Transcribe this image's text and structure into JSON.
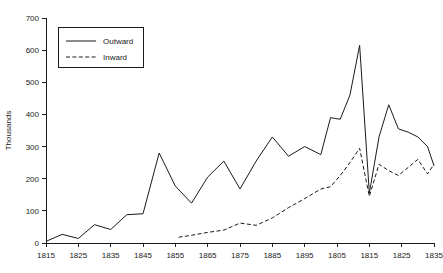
{
  "chart_data": {
    "type": "line",
    "title": "",
    "xlabel": "",
    "ylabel": "Thousands",
    "ylim": [
      0,
      700
    ],
    "ytick_step": 100,
    "ytick_labels": [
      "0",
      "100",
      "200",
      "300",
      "400",
      "500",
      "600",
      "700"
    ],
    "xtick_labels": [
      "1815",
      "1825",
      "1835",
      "1845",
      "1855",
      "1865",
      "1875",
      "1885",
      "1895",
      "1805",
      "1815",
      "1825",
      "1835"
    ],
    "xtick_years": [
      1815,
      1825,
      1835,
      1845,
      1855,
      1865,
      1875,
      1885,
      1895,
      1905,
      1915,
      1925,
      1935
    ],
    "x_range": [
      1815,
      1935
    ],
    "grid": false,
    "legend_position": "upper-left",
    "legend": [
      "Outward",
      "Inward"
    ],
    "line_color": "#1a1a1a",
    "background_color": "#ffffff",
    "series": [
      {
        "name": "Outward",
        "style": "solid",
        "x": [
          1815,
          1820,
          1825,
          1830,
          1835,
          1840,
          1845,
          1850,
          1855,
          1860,
          1865,
          1870,
          1875,
          1880,
          1885,
          1890,
          1895,
          1900,
          1903,
          1906,
          1909,
          1912,
          1915,
          1918,
          1921,
          1924,
          1927,
          1930,
          1933,
          1935
        ],
        "values": [
          5,
          27,
          14,
          57,
          42,
          88,
          91,
          280,
          177,
          124,
          205,
          255,
          168,
          255,
          330,
          270,
          300,
          275,
          390,
          385,
          460,
          615,
          155,
          330,
          430,
          355,
          345,
          330,
          300,
          240
        ]
      },
      {
        "name": "Inward",
        "style": "dashed",
        "x": [
          1856,
          1860,
          1865,
          1870,
          1875,
          1880,
          1885,
          1890,
          1895,
          1900,
          1903,
          1906,
          1909,
          1912,
          1915,
          1918,
          1921,
          1924,
          1927,
          1930,
          1933,
          1935
        ],
        "values": [
          18,
          24,
          33,
          40,
          62,
          55,
          78,
          110,
          138,
          168,
          175,
          210,
          250,
          295,
          145,
          245,
          225,
          210,
          235,
          260,
          215,
          245
        ]
      }
    ]
  },
  "legend": {
    "outward_label": "Outward",
    "inward_label": "Inward"
  },
  "axes": {
    "y_title": "Thousands"
  }
}
